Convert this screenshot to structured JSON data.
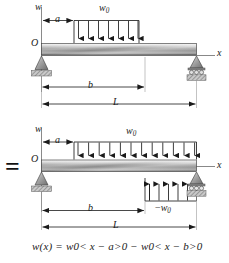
{
  "figure": {
    "equals_sign": "=",
    "equation": {
      "lhs": "w(x)",
      "eq": "=",
      "term1_coeff": "w",
      "term1_sub": "0",
      "term1_bracket_open": "<",
      "term1_arg": "x − a",
      "term1_bracket_close": ">",
      "term1_exp": "0",
      "operator": "−",
      "term2_coeff": "w",
      "term2_sub": "0",
      "term2_bracket_open": "<",
      "term2_arg": "x − b",
      "term2_bracket_close": ">",
      "term2_exp": "0",
      "full_text": "w(x) = w0 < x − a >0 − w0 < x − b >0"
    }
  },
  "diagram_top": {
    "axis_w_label": "w",
    "axis_x_label": "x",
    "origin_label": "O",
    "load_label": "w",
    "load_label_sub": "0",
    "dim_a": "a",
    "dim_b": "b",
    "dim_L": "L",
    "load_arrow_count": 7,
    "support_left": "pin-support",
    "support_right": "roller-support"
  },
  "diagram_bottom": {
    "axis_w_label": "w",
    "axis_x_label": "x",
    "origin_label": "O",
    "load_label_top": "w",
    "load_label_top_sub": "0",
    "load_label_bottom_sign": "−",
    "load_label_bottom": "w",
    "load_label_bottom_sub": "0",
    "dim_a": "a",
    "dim_b": "b",
    "dim_L": "L",
    "load_arrow_count_down": 12,
    "load_arrow_count_up": 5,
    "support_left": "pin-support",
    "support_right": "roller-support"
  },
  "colors": {
    "line": "#1a1a1a",
    "beam_light": "#f2f2f2",
    "beam_mid": "#8f8f8f",
    "beam_dark": "#6e6e6e",
    "support_fill": "#b3b3b3",
    "hatch": "#8c8c8c",
    "background": "#ffffff"
  }
}
